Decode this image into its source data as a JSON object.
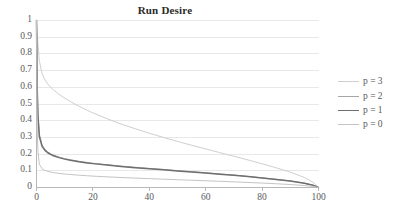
{
  "chart_data": {
    "type": "line",
    "title": "Run Desire",
    "xlabel": "",
    "ylabel": "",
    "xlim": [
      0,
      100
    ],
    "ylim": [
      0,
      1
    ],
    "grid": true,
    "grid_axis": "y",
    "legend_position": "right",
    "x_ticks": [
      "0",
      "20",
      "40",
      "60",
      "80",
      "100"
    ],
    "x_tick_values": [
      0,
      20,
      40,
      60,
      80,
      100
    ],
    "y_ticks": [
      "0",
      "0.1",
      "0.2",
      "0.3",
      "0.4",
      "0.5",
      "0.6",
      "0.7",
      "0.8",
      "0.9",
      "1"
    ],
    "y_tick_values": [
      0,
      0.1,
      0.2,
      0.3,
      0.4,
      0.5,
      0.6,
      0.7,
      0.8,
      0.9,
      1
    ],
    "x": [
      0,
      0.25,
      0.5,
      1,
      2,
      3,
      4,
      5,
      6,
      8,
      10,
      12,
      15,
      18,
      20,
      25,
      30,
      35,
      40,
      45,
      50,
      55,
      60,
      65,
      70,
      75,
      80,
      85,
      90,
      95,
      98,
      100
    ],
    "series": [
      {
        "name": "p = 3",
        "color": "#cfcfcf",
        "width": 1.0,
        "values": [
          1.0,
          0.93,
          0.86,
          0.76,
          0.68,
          0.645,
          0.62,
          0.6,
          0.585,
          0.558,
          0.535,
          0.515,
          0.487,
          0.462,
          0.447,
          0.412,
          0.38,
          0.352,
          0.325,
          0.3,
          0.276,
          0.253,
          0.231,
          0.209,
          0.187,
          0.165,
          0.142,
          0.118,
          0.092,
          0.06,
          0.032,
          0.0
        ]
      },
      {
        "name": "p = 2",
        "color": "#a6a6a6",
        "width": 1.0,
        "values": [
          1.0,
          0.62,
          0.45,
          0.32,
          0.255,
          0.228,
          0.213,
          0.202,
          0.194,
          0.182,
          0.173,
          0.166,
          0.157,
          0.15,
          0.145,
          0.136,
          0.128,
          0.121,
          0.114,
          0.108,
          0.101,
          0.095,
          0.088,
          0.081,
          0.074,
          0.066,
          0.058,
          0.049,
          0.039,
          0.026,
          0.014,
          0.0
        ]
      },
      {
        "name": "p = 1",
        "color": "#6f6f6f",
        "width": 1.5,
        "values": [
          1.0,
          0.6,
          0.43,
          0.305,
          0.245,
          0.222,
          0.208,
          0.198,
          0.19,
          0.179,
          0.17,
          0.163,
          0.154,
          0.147,
          0.143,
          0.134,
          0.126,
          0.119,
          0.112,
          0.106,
          0.0995,
          0.0935,
          0.0868,
          0.08,
          0.073,
          0.0652,
          0.0573,
          0.0485,
          0.0385,
          0.0257,
          0.0139,
          0.0
        ]
      },
      {
        "name": "p = 0",
        "color": "#c4c4c4",
        "width": 1.0,
        "values": [
          1.0,
          0.35,
          0.22,
          0.14,
          0.112,
          0.102,
          0.0965,
          0.0925,
          0.0893,
          0.0845,
          0.0808,
          0.0777,
          0.0737,
          0.0703,
          0.0682,
          0.0638,
          0.0598,
          0.0563,
          0.0529,
          0.0497,
          0.0466,
          0.0435,
          0.0404,
          0.0372,
          0.0339,
          0.0303,
          0.0265,
          0.0224,
          0.0177,
          0.0118,
          0.0064,
          0.0
        ]
      }
    ]
  },
  "axis": {
    "axis_color": "#b8b8b8",
    "grid_color": "#e8e8e8",
    "tick_color": "#59595a"
  }
}
